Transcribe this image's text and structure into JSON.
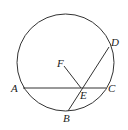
{
  "diagram": {
    "type": "circle-geometry",
    "circle": {
      "cx": 65.5,
      "cy": 62.5,
      "r": 48.5
    },
    "points": {
      "A": {
        "x": 23,
        "y": 88,
        "label": "A",
        "lx": 11,
        "ly": 92
      },
      "C": {
        "x": 106,
        "y": 88,
        "label": "C",
        "lx": 108,
        "ly": 92
      },
      "D": {
        "x": 109,
        "y": 47,
        "label": "D",
        "lx": 111,
        "ly": 46
      },
      "B": {
        "x": 68,
        "y": 111,
        "label": "B",
        "lx": 63,
        "ly": 122
      },
      "E": {
        "x": 81,
        "y": 88,
        "label": "E",
        "lx": 80,
        "ly": 99
      },
      "F": {
        "x": 64,
        "y": 66,
        "label": "F",
        "lx": 57,
        "ly": 67
      }
    },
    "segments": [
      "AC",
      "BD",
      "FE"
    ]
  }
}
